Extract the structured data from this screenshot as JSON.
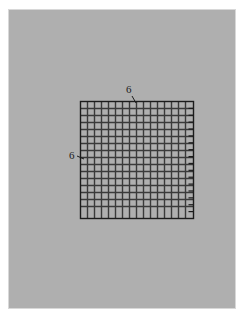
{
  "figure": {
    "type": "geometry-diagram",
    "background_color": "#afafaf",
    "page_color": "#ffffff",
    "frame_border_color": "#d8d8d8",
    "line_color": "#3a3a3a",
    "outline_color": "#1c1c1c",
    "label_color": "#1c1c1c"
  },
  "square": {
    "name": "outer-square",
    "left_px": 80,
    "top_px": 101,
    "width_px": 113,
    "height_px": 117,
    "side_length": 6,
    "units": ""
  },
  "labels": {
    "top": "6",
    "left": "6"
  },
  "nested_corners": {
    "count": 16,
    "spacing_px": 7.0,
    "origin": "top-left",
    "stroke_width_px": 1.4
  },
  "ticks": {
    "edge": "right-inner",
    "count": 16,
    "length_px": 5,
    "stroke_width_px": 1.2
  },
  "chart_data": {
    "type": "table",
    "categories": [
      "top side",
      "left side"
    ],
    "values": [
      6,
      6
    ],
    "xlabel": "",
    "ylabel": "",
    "annotations": [
      "6",
      "6"
    ]
  }
}
